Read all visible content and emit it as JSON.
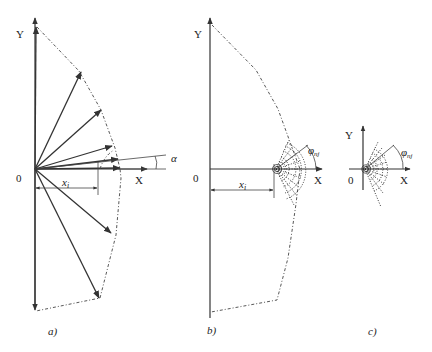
{
  "panels": [
    {
      "id": "a",
      "caption": "a)",
      "axis_x_label": "X",
      "axis_y_label": "Y",
      "origin_label": "0",
      "distance_label": "x",
      "distance_subscript": "i",
      "angle_label": "α"
    },
    {
      "id": "b",
      "caption": "b)",
      "axis_x_label": "X",
      "axis_y_label": "Y",
      "origin_label": "0",
      "distance_label": "x",
      "distance_subscript": "i",
      "angle_label": "φ",
      "angle_subscript": "nj"
    },
    {
      "id": "c",
      "caption": "c)",
      "axis_x_label": "X",
      "axis_y_label": "Y",
      "origin_label": "0",
      "angle_label": "φ",
      "angle_subscript": "nj"
    }
  ],
  "colors": {
    "line": "#333333",
    "background": "#ffffff"
  }
}
